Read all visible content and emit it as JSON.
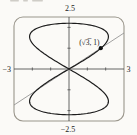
{
  "figure": {
    "background": "#fbfaf7",
    "frame_color": "#9a968c",
    "axis_color": "#3f3f3f",
    "curve_color": "#1c1c1c",
    "line_color": "#8a8a8a",
    "point_color": "#111111",
    "label_color": "#222222",
    "artifact_color": "#b9b6ae"
  },
  "labels": {
    "y_max": "2.5",
    "y_min": "−2.5",
    "x_min": "−3",
    "x_max": "3",
    "point": "(√3̅, 1)"
  },
  "chart_data": {
    "type": "line",
    "title": "",
    "xlabel": "",
    "ylabel": "",
    "xlim": [
      -3,
      3
    ],
    "ylim": [
      -2.5,
      2.5
    ],
    "x_ticks": [
      -2,
      -1,
      1,
      2
    ],
    "y_ticks": [
      -2,
      -1,
      1,
      2
    ],
    "x_edge_labels": [
      "−3",
      "3"
    ],
    "y_edge_labels": [
      "2.5",
      "−2.5"
    ],
    "grid": false,
    "legend": false,
    "frame": "rounded-rectangle",
    "series": [
      {
        "name": "figure-eight-curve",
        "kind": "parametric",
        "x_equation": "a·sin(2t)",
        "y_equation": "b·sin(t)",
        "a": 2.15,
        "b": 2.2,
        "t_range": [
          0,
          6.2832
        ],
        "samples": 240
      },
      {
        "name": "line-through-origin",
        "kind": "linear",
        "slope_expr": "1/√3",
        "slope": 0.57735,
        "intercept": 0,
        "x_range": [
          -3,
          3
        ]
      }
    ],
    "points": [
      {
        "label": "(√3, 1)",
        "x": 1.73205,
        "y": 1
      }
    ]
  }
}
